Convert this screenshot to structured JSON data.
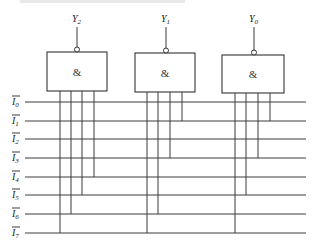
{
  "diagram": {
    "title": "",
    "type": "AND-gate decoder wiring",
    "gates": [
      {
        "id": "Y2",
        "output_label": "Y",
        "output_sub": "2",
        "symbol": "&",
        "box": {
          "x": 47,
          "y": 52,
          "w": 60,
          "h": 39
        },
        "output_x": 77,
        "inputs": [
          {
            "x": 60,
            "line": 7
          },
          {
            "x": 71,
            "line": 6
          },
          {
            "x": 82,
            "line": 5
          },
          {
            "x": 94,
            "line": 4
          }
        ]
      },
      {
        "id": "Y1",
        "output_label": "Y",
        "output_sub": "1",
        "symbol": "&",
        "box": {
          "x": 135,
          "y": 53,
          "w": 60,
          "h": 39
        },
        "output_x": 166,
        "inputs": [
          {
            "x": 147,
            "line": 7
          },
          {
            "x": 158,
            "line": 6
          },
          {
            "x": 170,
            "line": 3
          },
          {
            "x": 182,
            "line": 1
          }
        ]
      },
      {
        "id": "Y0",
        "output_label": "Y",
        "output_sub": "0",
        "symbol": "&",
        "box": {
          "x": 222,
          "y": 55,
          "w": 62,
          "h": 38
        },
        "output_x": 254,
        "inputs": [
          {
            "x": 235,
            "line": 7
          },
          {
            "x": 246,
            "line": 5
          },
          {
            "x": 258,
            "line": 3
          },
          {
            "x": 270,
            "line": 1
          }
        ]
      }
    ],
    "input_lines": [
      {
        "label": "I",
        "sub": "0",
        "inverted": true,
        "y": 102
      },
      {
        "label": "I",
        "sub": "1",
        "inverted": true,
        "y": 121
      },
      {
        "label": "I",
        "sub": "2",
        "inverted": true,
        "y": 139
      },
      {
        "label": "I",
        "sub": "3",
        "inverted": true,
        "y": 158
      },
      {
        "label": "I",
        "sub": "4",
        "inverted": true,
        "y": 177
      },
      {
        "label": "I",
        "sub": "5",
        "inverted": true,
        "y": 195
      },
      {
        "label": "I",
        "sub": "6",
        "inverted": true,
        "y": 214
      },
      {
        "label": "I",
        "sub": "7",
        "inverted": true,
        "y": 233
      }
    ],
    "line_x_start": 25,
    "line_x_end": 306,
    "colors": {
      "stroke": "#3a3a3a",
      "background": "#ffffff"
    }
  }
}
